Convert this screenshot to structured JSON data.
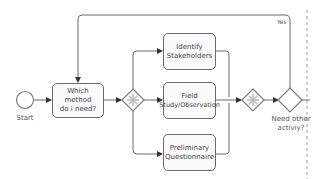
{
  "diagram": {
    "type": "bpmn-process",
    "start_event": {
      "label": "Start"
    },
    "tasks": [
      {
        "id": "which-method",
        "label_line1": "Which method",
        "label_line2": "do i need?"
      },
      {
        "id": "identify-stakeholders",
        "label_line1": "Identify",
        "label_line2": "Stakeholders"
      },
      {
        "id": "field-study",
        "label_line1": "Field",
        "label_line2": "Study/Observation"
      },
      {
        "id": "preliminary-questionnaire",
        "label_line1": "Preliminary",
        "label_line2": "Questionnaire"
      }
    ],
    "gateways": [
      {
        "id": "parallel-split",
        "type": "parallel-complex"
      },
      {
        "id": "parallel-join",
        "type": "parallel-complex"
      },
      {
        "id": "decision",
        "type": "exclusive",
        "label_line1": "Need other",
        "label_line2": "activiy?"
      }
    ],
    "flows": [
      {
        "from": "start",
        "to": "which-method"
      },
      {
        "from": "which-method",
        "to": "parallel-split"
      },
      {
        "from": "parallel-split",
        "to": "identify-stakeholders"
      },
      {
        "from": "parallel-split",
        "to": "field-study"
      },
      {
        "from": "parallel-split",
        "to": "preliminary-questionnaire"
      },
      {
        "from": "identify-stakeholders",
        "to": "parallel-join"
      },
      {
        "from": "field-study",
        "to": "parallel-join"
      },
      {
        "from": "preliminary-questionnaire",
        "to": "parallel-join"
      },
      {
        "from": "parallel-join",
        "to": "decision"
      },
      {
        "from": "decision",
        "to": "which-method",
        "label": "Yes"
      }
    ],
    "yes_label": "Yes",
    "colors": {
      "stroke": "#6b6b6b",
      "fill": "#fafafa",
      "gateway_marker": "#c9c9c9",
      "dashed_line": "#9a9a9a"
    }
  }
}
